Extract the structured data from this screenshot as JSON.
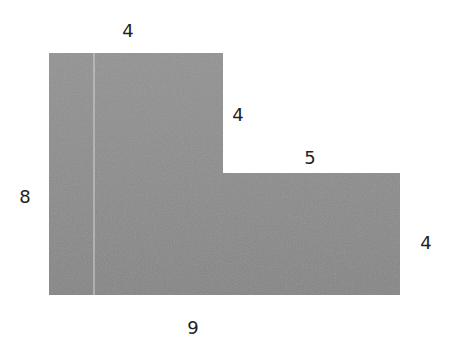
{
  "diagram": {
    "type": "L-shaped composite figure",
    "fill_color": "#8a8a8a",
    "divider_color": "#d8d8d8",
    "labels": {
      "top_width": "4",
      "inner_vertical": "4",
      "inner_horizontal": "5",
      "left_height": "8",
      "right_height": "4",
      "bottom_width": "9"
    }
  }
}
